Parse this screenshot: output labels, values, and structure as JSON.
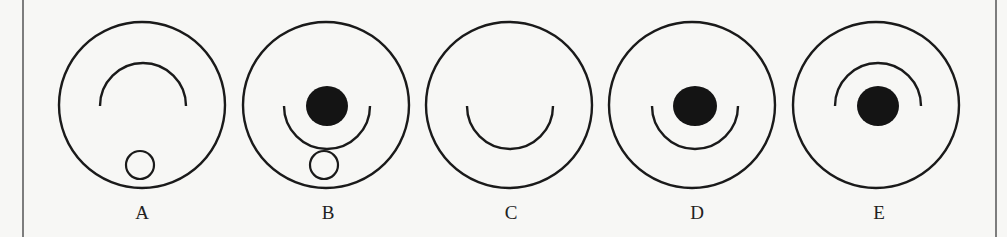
{
  "figure": {
    "stroke_color": "#1a1a1a",
    "fill_color": "#141414",
    "background": "#f7f7f5",
    "border_left_x": 23,
    "border_right_x": 996,
    "outer_radius": 83,
    "center_y": 105,
    "options": [
      {
        "label": "A",
        "cx": 142,
        "label_x": 142,
        "arc": {
          "direction": "up",
          "r": 43
        },
        "dot": null,
        "small_circle": {
          "cx": 140,
          "cy": 165,
          "r": 14
        }
      },
      {
        "label": "B",
        "cx": 326,
        "label_x": 328,
        "arc": {
          "direction": "down",
          "r": 43
        },
        "dot": {
          "cx": 327,
          "cy": 106,
          "rx": 21,
          "ry": 20
        },
        "small_circle": {
          "cx": 324,
          "cy": 165,
          "r": 14
        }
      },
      {
        "label": "C",
        "cx": 509,
        "label_x": 511,
        "arc": {
          "direction": "down",
          "r": 43
        },
        "dot": null,
        "small_circle": null
      },
      {
        "label": "D",
        "cx": 692,
        "label_x": 697,
        "arc": {
          "direction": "down",
          "r": 43
        },
        "dot": {
          "cx": 695,
          "cy": 106,
          "rx": 22,
          "ry": 20
        },
        "small_circle": null
      },
      {
        "label": "E",
        "cx": 876,
        "label_x": 879,
        "arc": {
          "direction": "up",
          "r": 43
        },
        "dot": {
          "cx": 878,
          "cy": 106,
          "rx": 21,
          "ry": 20
        },
        "small_circle": null
      }
    ]
  }
}
